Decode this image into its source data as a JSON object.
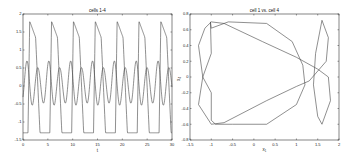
{
  "chart_data": [
    {
      "type": "line",
      "title": "cells 1-4",
      "xlabel": "t",
      "ylabel": "",
      "xlim": [
        0,
        30
      ],
      "ylim": [
        -1.5,
        2
      ],
      "xticks": [
        "0",
        "5",
        "10",
        "15",
        "20",
        "25",
        "30"
      ],
      "yticks": [
        "-1.5",
        "-1",
        "-0.5",
        "0",
        "0.5",
        "1",
        "1.5",
        "2"
      ],
      "grid": false,
      "series": [
        {
          "name": "cell 1",
          "description": "relaxation-like oscillation, period ~4.4, peaks ~1.8, troughs ~-1.3",
          "period": 4.4,
          "max": 1.8,
          "min": -1.3
        },
        {
          "name": "cell 4",
          "description": "double-hump oscillation, period ~4.4, peaks ~0.7, troughs ~-0.6",
          "period": 4.4,
          "max": 0.7,
          "min": -0.6
        }
      ]
    },
    {
      "type": "line",
      "title": "cell 1 vs. cell 4",
      "xlabel": "x1",
      "ylabel": "x4",
      "xlim": [
        -1.5,
        2
      ],
      "ylim": [
        -0.8,
        0.8
      ],
      "xticks": [
        "-1.5",
        "-1",
        "-0.5",
        "0",
        "0.5",
        "1",
        "1.5",
        "2"
      ],
      "yticks": [
        "-0.8",
        "-0.6",
        "-0.4",
        "-0.2",
        "0",
        "0.2",
        "0.4",
        "0.6",
        "0.8"
      ],
      "grid": false,
      "series": [
        {
          "name": "phase portrait x1 vs x4",
          "description": "closed limit-cycle curve with loops near x1=-1 and x1=1.6"
        }
      ]
    }
  ],
  "plots": {
    "left": {
      "title": "cells 1-4",
      "xlabel": "t",
      "xticks": [
        "0",
        "5",
        "10",
        "15",
        "20",
        "25",
        "30"
      ],
      "yticks": [
        "-1.5",
        "-1",
        "-0.5",
        "0",
        "0.5",
        "1",
        "1.5",
        "2"
      ]
    },
    "right": {
      "title": "cell 1 vs. cell 4",
      "xlabel": "x₁",
      "ylabel": "x₄",
      "xticks": [
        "-1.5",
        "-1",
        "-0.5",
        "0",
        "0.5",
        "1",
        "1.5",
        "2"
      ],
      "yticks": [
        "-0.8",
        "-0.6",
        "-0.4",
        "-0.2",
        "0",
        "0.2",
        "0.4",
        "0.6",
        "0.8"
      ]
    }
  }
}
